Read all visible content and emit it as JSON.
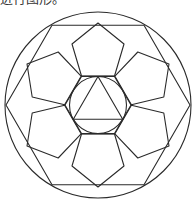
{
  "header": {
    "clipped_caption": "进行图形。"
  },
  "diagram": {
    "stroke_color": "#2a2a2a",
    "background": "#ffffff",
    "center": [
      98,
      105
    ],
    "outer_circle_radius": 93,
    "outer_hexagon_radius": 92,
    "inner_hexagon_radius": 33,
    "inner_circle_radius": 28.5,
    "triangle_radius": 28.5,
    "pentagon_count": 6,
    "pentagon_local_points": [
      [
        0,
        -82
      ],
      [
        26,
        -61
      ],
      [
        16.5,
        -29
      ],
      [
        -16.5,
        -29
      ],
      [
        -26,
        -61
      ]
    ]
  }
}
